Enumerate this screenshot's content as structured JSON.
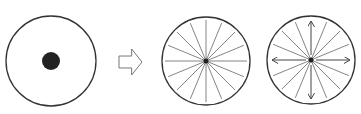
{
  "diagram": {
    "panels": [
      {
        "id": "panel-1",
        "shape": "circle",
        "cx": 51,
        "cy": 61,
        "r": 45,
        "center_dot_r": 9,
        "spokes": 0,
        "arrows": false
      },
      {
        "id": "panel-2",
        "shape": "circle-with-spokes",
        "cx": 206,
        "cy": 61,
        "r": 44,
        "spokes": 16,
        "arrows": false
      },
      {
        "id": "panel-3",
        "shape": "circle-with-spokes-and-arrows",
        "cx": 311,
        "cy": 60,
        "r": 44,
        "spokes": 16,
        "arrows": true,
        "arrow_directions": [
          "up",
          "down",
          "left",
          "right"
        ]
      }
    ],
    "transition_arrow": {
      "direction": "right",
      "style": "hollow-block-arrow",
      "x": 119,
      "y": 49,
      "width": 23,
      "height": 26
    },
    "colors": {
      "outline": "#333333",
      "spoke": "#777777",
      "dot": "#222222",
      "arrow_outline": "#777777",
      "background": "#ffffff"
    }
  }
}
